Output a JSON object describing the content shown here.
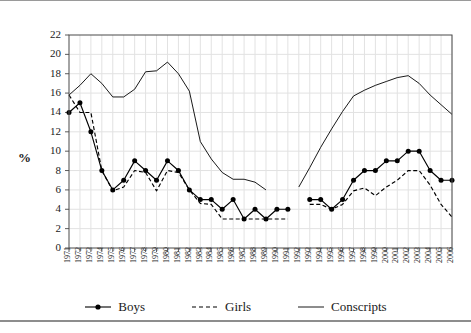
{
  "chart_data": {
    "type": "line",
    "title": "",
    "subtitle": "",
    "xlabel": "",
    "ylabel": "%",
    "ylim": [
      0,
      22
    ],
    "ytick_step": 2,
    "yticks": [
      0,
      2,
      4,
      6,
      8,
      10,
      12,
      14,
      16,
      18,
      20,
      22
    ],
    "grid": true,
    "legend_position": "bottom",
    "categories": [
      "1971",
      "1972",
      "1973",
      "1974",
      "1975",
      "1976",
      "1977",
      "1978",
      "1979",
      "1980",
      "1981",
      "1982",
      "1983",
      "1984",
      "1985",
      "1986",
      "1987",
      "1988",
      "1989",
      "1990",
      "1991",
      "1992",
      "1993",
      "1994",
      "1995",
      "1996",
      "1997",
      "1998",
      "1999",
      "2000",
      "2001",
      "2002",
      "2003",
      "2004",
      "2005",
      "2006"
    ],
    "series": [
      {
        "name": "Boys",
        "style": "solid-markers",
        "color": "#000000",
        "values": [
          14,
          15,
          12,
          8,
          6,
          7,
          9,
          8,
          7,
          9,
          8,
          6,
          5,
          5,
          4,
          5,
          3,
          4,
          3,
          4,
          4,
          null,
          5,
          5,
          4,
          5,
          7,
          8,
          8,
          9,
          9,
          10,
          10,
          8,
          7,
          7
        ],
        "note_trailing": [
          7,
          7,
          7,
          7
        ]
      },
      {
        "name": "Girls",
        "style": "dashed",
        "color": "#000000",
        "values": [
          15.8,
          14,
          14,
          8,
          5.9,
          6.3,
          8,
          7.8,
          5.9,
          8,
          7.8,
          6,
          4.6,
          4.5,
          3,
          3,
          3,
          3,
          3,
          3,
          3,
          null,
          4.5,
          4.5,
          4,
          4.5,
          5.9,
          6.2,
          5.4,
          6.3,
          7,
          8,
          8,
          6.5,
          4.5,
          3.2
        ]
      },
      {
        "name": "Conscripts",
        "style": "solid-thin",
        "color": "#000000",
        "values": [
          15.8,
          16.8,
          18,
          17,
          15.6,
          15.6,
          16.4,
          18.2,
          18.3,
          19.2,
          18,
          16.2,
          11,
          9.2,
          7.8,
          7.1,
          7.1,
          6.8,
          6,
          null,
          null,
          6.3,
          8.3,
          10.4,
          12.3,
          14.1,
          15.7,
          16.3,
          16.8,
          17.2,
          17.6,
          17.8,
          17,
          15.8,
          14.8,
          13.8
        ]
      }
    ]
  },
  "legend": {
    "items": [
      {
        "label": "Boys",
        "marker": "line-with-dot"
      },
      {
        "label": "Girls",
        "marker": "dashed-line"
      },
      {
        "label": "Conscripts",
        "marker": "solid-line"
      }
    ]
  },
  "axes": {
    "y_axis_title": "%",
    "y_tick_labels": [
      "0",
      "2",
      "4",
      "6",
      "8",
      "10",
      "12",
      "14",
      "16",
      "18",
      "20",
      "22"
    ],
    "x_tick_labels": [
      "1971",
      "1972",
      "1973",
      "1974",
      "1975",
      "1976",
      "1977",
      "1978",
      "1979",
      "1980",
      "1981",
      "1982",
      "1983",
      "1984",
      "1985",
      "1986",
      "1987",
      "1988",
      "1989",
      "1990",
      "1991",
      "1992",
      "1993",
      "1994",
      "1995",
      "1996",
      "1997",
      "1998",
      "1999",
      "2000",
      "2001",
      "2002",
      "2003",
      "2004",
      "2005",
      "2006"
    ]
  },
  "colors": {
    "axis": "#4a4a4a",
    "grid": "#e2e2e2",
    "series": "#000000",
    "rule": "#8d8d8d",
    "background": "#ffffff"
  }
}
